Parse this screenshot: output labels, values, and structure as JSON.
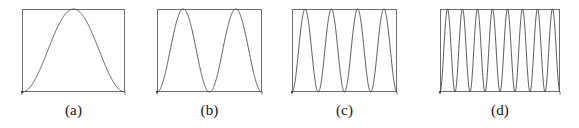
{
  "figure": {
    "background_color": "#ffffff",
    "ink_color": "#4a4a4a",
    "frame_color": "#6e6e6e",
    "label_color": "#151515",
    "panel_count": 4
  },
  "panels": [
    {
      "id": "panel-a",
      "label": "(a)",
      "arches": 1,
      "frame": {
        "x": 22,
        "y": 9,
        "width": 103,
        "height": 83
      },
      "label_y": 103
    },
    {
      "id": "panel-b",
      "label": "(b)",
      "arches": 2,
      "frame": {
        "x": 157,
        "y": 9,
        "width": 105,
        "height": 83
      },
      "label_y": 103
    },
    {
      "id": "panel-c",
      "label": "(c)",
      "arches": 4,
      "frame": {
        "x": 292,
        "y": 9,
        "width": 105,
        "height": 83
      },
      "label_y": 103
    },
    {
      "id": "panel-d",
      "label": "(d)",
      "arches": 8,
      "frame": {
        "x": 440,
        "y": 9,
        "width": 120,
        "height": 83
      },
      "label_y": 103
    }
  ],
  "chart_data": {
    "type": "line",
    "title": "",
    "xlabel": "",
    "ylabel": "",
    "xlim": [
      0,
      1
    ],
    "ylim": [
      0,
      1
    ],
    "grid": false,
    "legend": null,
    "panels": [
      {
        "label": "(a)",
        "formula": "sin^2(pi*x)",
        "arches": 1,
        "peaks": 1,
        "troughs_interior": 0,
        "peak_x": [
          0.5
        ],
        "trough_x": [
          0.0,
          1.0
        ],
        "ymin": 0,
        "ymax": 1
      },
      {
        "label": "(b)",
        "formula": "sin^2(2*pi*x)",
        "arches": 2,
        "peaks": 2,
        "troughs_interior": 1,
        "peak_x": [
          0.25,
          0.75
        ],
        "trough_x": [
          0.0,
          0.5,
          1.0
        ],
        "ymin": 0,
        "ymax": 1
      },
      {
        "label": "(c)",
        "formula": "sin^2(4*pi*x)",
        "arches": 4,
        "peaks": 4,
        "troughs_interior": 3,
        "peak_x": [
          0.125,
          0.375,
          0.625,
          0.875
        ],
        "trough_x": [
          0.0,
          0.25,
          0.5,
          0.75,
          1.0
        ],
        "ymin": 0,
        "ymax": 1
      },
      {
        "label": "(d)",
        "formula": "sin^2(8*pi*x)",
        "arches": 8,
        "peaks": 8,
        "troughs_interior": 7,
        "peak_x": [
          0.0625,
          0.1875,
          0.3125,
          0.4375,
          0.5625,
          0.6875,
          0.8125,
          0.9375
        ],
        "trough_x": [
          0.0,
          0.125,
          0.25,
          0.375,
          0.5,
          0.625,
          0.75,
          0.875,
          1.0
        ],
        "ymin": 0,
        "ymax": 1
      }
    ]
  }
}
